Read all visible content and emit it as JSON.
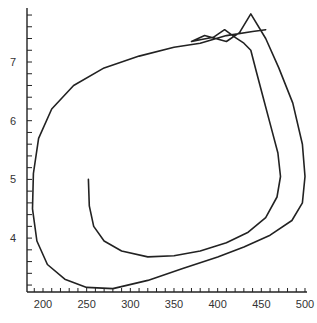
{
  "chart_data": {
    "type": "line",
    "title": "",
    "xlabel": "",
    "ylabel": "",
    "xlim": [
      183,
      505
    ],
    "ylim": [
      3.1,
      7.9
    ],
    "grid": false,
    "legend": null,
    "x_ticks": [
      "200",
      "250",
      "300",
      "350",
      "400",
      "450",
      "500"
    ],
    "y_ticks": [
      "4",
      "5",
      "6",
      "7"
    ],
    "series": [
      {
        "name": "trajectory",
        "color": "#222222",
        "points": [
          [
            252,
            5.0
          ],
          [
            253,
            4.55
          ],
          [
            258,
            4.2
          ],
          [
            270,
            3.95
          ],
          [
            290,
            3.78
          ],
          [
            320,
            3.68
          ],
          [
            350,
            3.7
          ],
          [
            380,
            3.78
          ],
          [
            410,
            3.92
          ],
          [
            435,
            4.1
          ],
          [
            455,
            4.35
          ],
          [
            468,
            4.7
          ],
          [
            472,
            5.05
          ],
          [
            469,
            5.45
          ],
          [
            461,
            5.9
          ],
          [
            452,
            6.4
          ],
          [
            444,
            6.85
          ],
          [
            438,
            7.2
          ],
          [
            430,
            7.32
          ],
          [
            420,
            7.42
          ],
          [
            408,
            7.55
          ],
          [
            395,
            7.42
          ],
          [
            380,
            7.38
          ],
          [
            370,
            7.35
          ],
          [
            385,
            7.45
          ],
          [
            410,
            7.35
          ],
          [
            425,
            7.5
          ],
          [
            438,
            7.82
          ],
          [
            455,
            7.4
          ],
          [
            470,
            6.9
          ],
          [
            486,
            6.3
          ],
          [
            497,
            5.6
          ],
          [
            500,
            5.05
          ],
          [
            497,
            4.6
          ],
          [
            485,
            4.3
          ],
          [
            460,
            4.05
          ],
          [
            430,
            3.85
          ],
          [
            400,
            3.68
          ],
          [
            360,
            3.48
          ],
          [
            320,
            3.28
          ],
          [
            280,
            3.14
          ],
          [
            250,
            3.16
          ],
          [
            225,
            3.3
          ],
          [
            205,
            3.55
          ],
          [
            193,
            3.95
          ],
          [
            188,
            4.5
          ],
          [
            189,
            5.1
          ],
          [
            195,
            5.7
          ],
          [
            210,
            6.2
          ],
          [
            235,
            6.6
          ],
          [
            270,
            6.9
          ],
          [
            310,
            7.1
          ],
          [
            350,
            7.25
          ],
          [
            380,
            7.32
          ],
          [
            410,
            7.45
          ],
          [
            440,
            7.52
          ],
          [
            455,
            7.55
          ]
        ]
      }
    ]
  }
}
